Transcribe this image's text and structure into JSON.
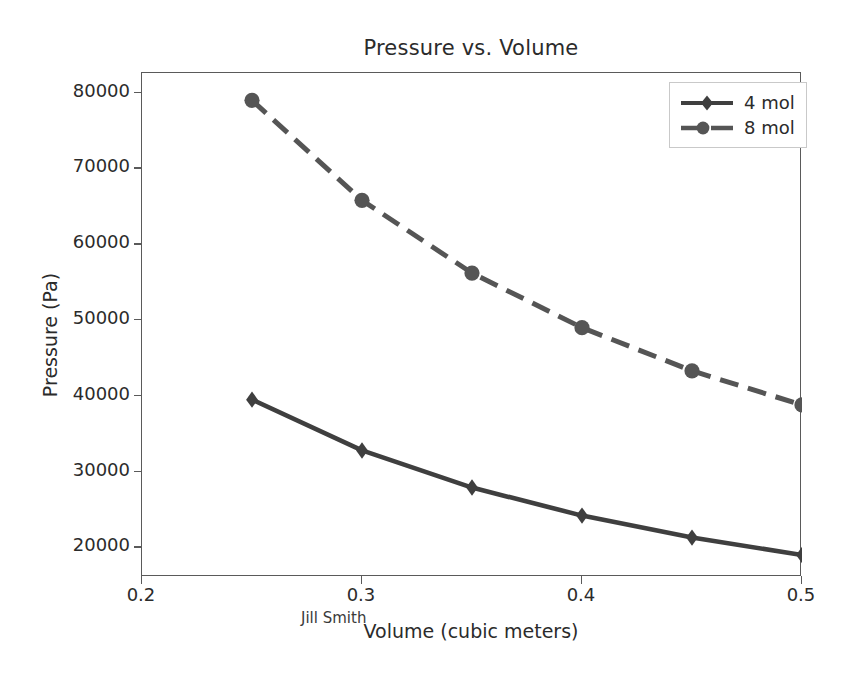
{
  "chart_data": {
    "type": "line",
    "title": "Pressure vs. Volume",
    "xlabel": "Volume (cubic meters)",
    "ylabel": "Pressure (Pa)",
    "xlim": [
      0.2,
      0.5
    ],
    "ylim": [
      16100,
      82600
    ],
    "grid": false,
    "legend_position": "upper right",
    "annotation": "Jill Smith",
    "x": [
      0.25,
      0.3,
      0.35,
      0.4,
      0.45,
      0.5
    ],
    "xticks": [
      "0.2",
      "0.3",
      "0.4",
      "0.5"
    ],
    "xtick_values": [
      0.2,
      0.3,
      0.4,
      0.5
    ],
    "yticks": [
      "20000",
      "30000",
      "40000",
      "50000",
      "60000",
      "70000",
      "80000"
    ],
    "ytick_values": [
      20000,
      30000,
      40000,
      50000,
      60000,
      70000,
      80000
    ],
    "series": [
      {
        "name": "4 mol",
        "values": [
          39500,
          32800,
          27900,
          24200,
          21300,
          19000
        ],
        "color": "#3f3f3f",
        "linestyle": "solid",
        "marker": "diamond"
      },
      {
        "name": "8 mol",
        "values": [
          79000,
          65800,
          56200,
          49000,
          43300,
          38800
        ],
        "color": "#555555",
        "linestyle": "dashed",
        "marker": "circle"
      }
    ]
  },
  "axis": {
    "spine_color": "#5a5a5a"
  }
}
